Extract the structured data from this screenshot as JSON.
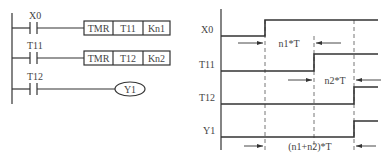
{
  "ladder": {
    "rungs": [
      {
        "contact": "X0",
        "instruction": "TMR",
        "operand": "T11",
        "constant": "Kn1"
      },
      {
        "contact": "T11",
        "instruction": "TMR",
        "operand": "T12",
        "constant": "Kn2"
      },
      {
        "contact": "T12",
        "coil": "Y1"
      }
    ]
  },
  "timing": {
    "signals": [
      "X0",
      "T11",
      "T12",
      "Y1"
    ],
    "intervals": {
      "first": "n1*T",
      "second": "n2*T",
      "total": "(n1+n2)*T"
    }
  },
  "colors": {
    "line": "#333333",
    "background": "#ffffff"
  }
}
